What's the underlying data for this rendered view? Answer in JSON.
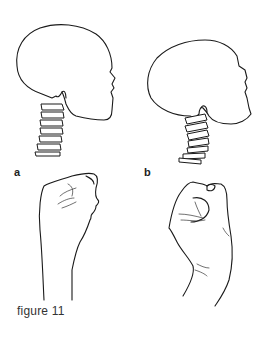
{
  "figure": {
    "caption": "figure 11",
    "panels": [
      {
        "label": "a",
        "skull": "skull-upright",
        "hand": "hand-pinch"
      },
      {
        "label": "b",
        "skull": "skull-tilted",
        "hand": "hand-fist"
      }
    ]
  },
  "colors": {
    "ink": "#1a1a1a",
    "background": "#ffffff",
    "caption": "#333333"
  }
}
